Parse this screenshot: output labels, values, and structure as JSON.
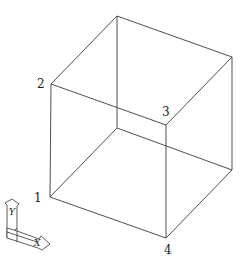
{
  "diagram": {
    "type": "wireframe-cube",
    "vertices": {
      "top_back": [
        117,
        16
      ],
      "top_right": [
        232,
        57
      ],
      "v2": [
        51,
        84
      ],
      "v3": [
        166,
        125
      ],
      "back_inner": [
        117,
        128
      ],
      "bottom_right": [
        232,
        170
      ],
      "v1": [
        50,
        197
      ],
      "v4": [
        166,
        238
      ]
    },
    "labels": [
      {
        "id": "1",
        "text": "1",
        "x": 34,
        "y": 202
      },
      {
        "id": "2",
        "text": "2",
        "x": 37,
        "y": 85
      },
      {
        "id": "3",
        "text": "3",
        "x": 162,
        "y": 116
      },
      {
        "id": "4",
        "text": "4",
        "x": 164,
        "y": 252
      }
    ],
    "ucs_icon": {
      "x_label": "X",
      "y_label": "Y"
    },
    "colors": {
      "edge": "#3a3a3a",
      "background": "#ffffff"
    }
  }
}
